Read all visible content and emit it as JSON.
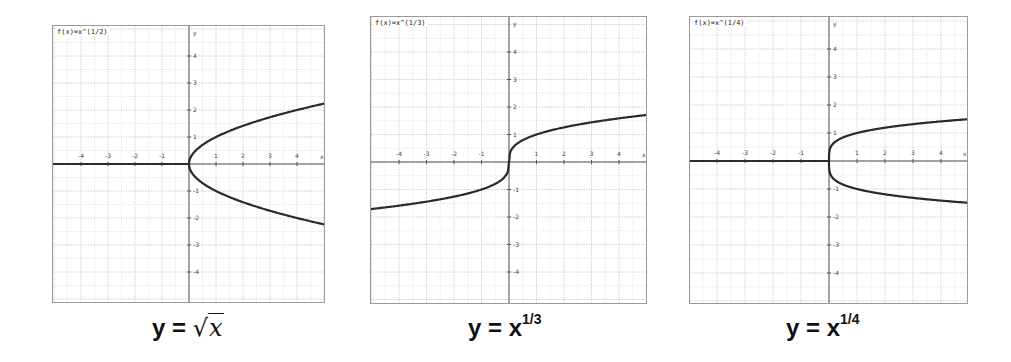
{
  "chart_data": [
    {
      "type": "line",
      "title": "f(x)=x^(1/2)",
      "caption": "y = √x",
      "xlabel": "x",
      "ylabel": "y",
      "xlim": [
        -5,
        5
      ],
      "ylim": [
        -5,
        5
      ],
      "xticks": [
        -4,
        -3,
        -2,
        -1,
        1,
        2,
        3,
        4
      ],
      "yticks": [
        -4,
        -3,
        -2,
        -1,
        1,
        2,
        3,
        4
      ],
      "grid": true,
      "series": [
        {
          "name": "negative x (drawn along axis)",
          "x": [
            -5,
            0
          ],
          "y": [
            0,
            0
          ]
        },
        {
          "name": "upper branch",
          "x": [
            0,
            0.25,
            0.5,
            1,
            2,
            3,
            4,
            5
          ],
          "y": [
            0,
            0.5,
            0.71,
            1,
            1.41,
            1.73,
            2,
            2.24
          ]
        },
        {
          "name": "lower branch",
          "x": [
            0,
            0.25,
            0.5,
            1,
            2,
            3,
            4,
            5
          ],
          "y": [
            0,
            -0.5,
            -0.71,
            -1,
            -1.41,
            -1.73,
            -2,
            -2.24
          ]
        }
      ]
    },
    {
      "type": "line",
      "title": "f(x)=x^(1/3)",
      "caption": "y = x^(1/3)",
      "xlabel": "x",
      "ylabel": "y",
      "xlim": [
        -5,
        5
      ],
      "ylim": [
        -5,
        5
      ],
      "xticks": [
        -4,
        -3,
        -2,
        -1,
        1,
        2,
        3,
        4
      ],
      "yticks": [
        -4,
        -3,
        -2,
        -1,
        1,
        2,
        3,
        4
      ],
      "grid": true,
      "series": [
        {
          "name": "cube root",
          "x": [
            -5,
            -4,
            -3,
            -2,
            -1,
            -0.5,
            -0.1,
            0,
            0.1,
            0.5,
            1,
            2,
            3,
            4,
            5
          ],
          "y": [
            -1.71,
            -1.59,
            -1.44,
            -1.26,
            -1,
            -0.79,
            -0.46,
            0,
            0.46,
            0.79,
            1,
            1.26,
            1.44,
            1.59,
            1.71
          ]
        }
      ]
    },
    {
      "type": "line",
      "title": "f(x)=x^(1/4)",
      "caption": "y = x^(1/4)",
      "xlabel": "x",
      "ylabel": "y",
      "xlim": [
        -5,
        5
      ],
      "ylim": [
        -5,
        5
      ],
      "xticks": [
        -4,
        -3,
        -2,
        -1,
        1,
        2,
        3,
        4
      ],
      "yticks": [
        -4,
        -3,
        -2,
        -1,
        1,
        2,
        3,
        4
      ],
      "grid": true,
      "series": [
        {
          "name": "negative x (drawn along axis)",
          "x": [
            -5,
            0
          ],
          "y": [
            0,
            0
          ]
        },
        {
          "name": "upper branch",
          "x": [
            0,
            0.1,
            0.5,
            1,
            2,
            3,
            4,
            5
          ],
          "y": [
            0,
            0.56,
            0.84,
            1,
            1.19,
            1.32,
            1.41,
            1.5
          ]
        },
        {
          "name": "lower branch",
          "x": [
            0,
            0.1,
            0.5,
            1,
            2,
            3,
            4,
            5
          ],
          "y": [
            0,
            -0.56,
            -0.84,
            -1,
            -1.19,
            -1.32,
            -1.41,
            -1.5
          ]
        }
      ]
    }
  ],
  "panels": [
    {
      "fn_label": "f(x)=x^(1/2)",
      "caption_prefix": "y = ",
      "caption_radical": "√",
      "caption_var": "x"
    },
    {
      "fn_label": "f(x)=x^(1/3)",
      "caption_prefix": "y = x",
      "caption_exp": "1/3"
    },
    {
      "fn_label": "f(x)=x^(1/4)",
      "caption_prefix": "y = x",
      "caption_exp": "1/4"
    }
  ],
  "axis": {
    "x_name": "x",
    "y_name": "y"
  },
  "colors": {
    "curve": "#2b2b2b",
    "axis": "#555555",
    "grid_major": "#c8c8c8",
    "grid_minor": "#e4e4e4",
    "border": "#9a9a9a"
  }
}
